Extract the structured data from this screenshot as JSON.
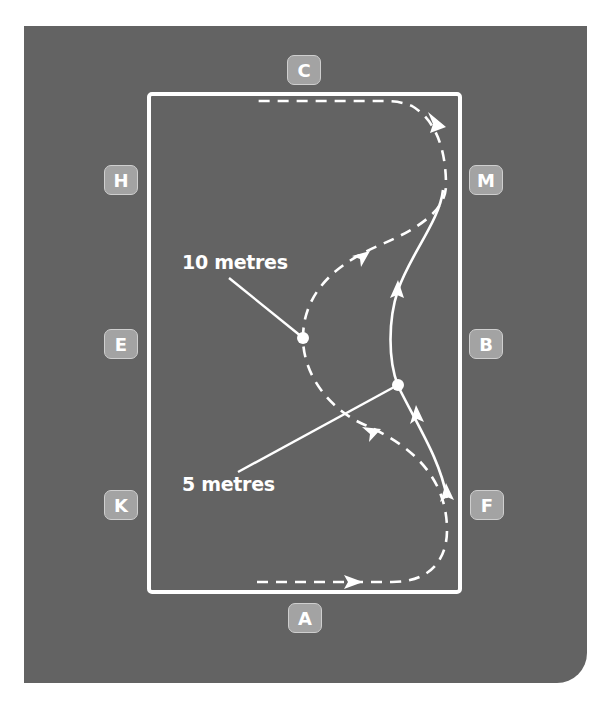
{
  "diagram": {
    "title": "",
    "colors": {
      "panel": "#636363",
      "arena_border": "#ffffff",
      "marker_fill": "#a3a3a3",
      "marker_text": "#ffffff",
      "path": "#ffffff"
    },
    "markers": {
      "C": "C",
      "H": "H",
      "M": "M",
      "E": "E",
      "B": "B",
      "K": "K",
      "F": "F",
      "A": "A"
    },
    "labels": {
      "ten_metres": "10 metres",
      "five_metres": "5 metres"
    },
    "paths": [
      {
        "name": "10 metre loop",
        "style": "dashed"
      },
      {
        "name": "5 metre loop",
        "style": "solid"
      }
    ]
  }
}
